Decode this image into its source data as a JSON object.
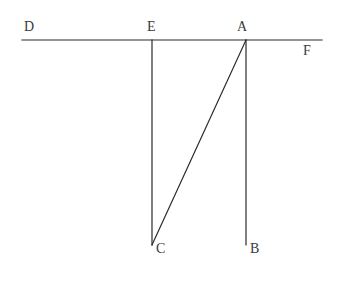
{
  "figure": {
    "background_color": "#ffffff",
    "stroke_color": "#2b2b2b",
    "label_color": "#3a3a3a",
    "stroke_width": 1.2,
    "width": 346,
    "height": 287
  },
  "labels": {
    "d": "D",
    "e": "E",
    "a": "A",
    "f": "F",
    "c": "C",
    "b": "B"
  },
  "geometry": {
    "points": [
      {
        "name": "D",
        "x": 22,
        "y": 40,
        "label_x": 24,
        "label_y": 20,
        "label_position": "above-right"
      },
      {
        "name": "E",
        "x": 152,
        "y": 40,
        "label_x": 147,
        "label_y": 20,
        "label_position": "above"
      },
      {
        "name": "A",
        "x": 246,
        "y": 40,
        "label_x": 237,
        "label_y": 20,
        "label_position": "above"
      },
      {
        "name": "F",
        "x": 322,
        "y": 40,
        "label_x": 303,
        "label_y": 44,
        "label_position": "below-left"
      },
      {
        "name": "C",
        "x": 152,
        "y": 245,
        "label_x": 156,
        "label_y": 242,
        "label_position": "below-right"
      },
      {
        "name": "B",
        "x": 246,
        "y": 245,
        "label_x": 250,
        "label_y": 242,
        "label_position": "below-right"
      }
    ],
    "segments": [
      {
        "name": "line-DF",
        "from": "D",
        "to": "F",
        "x1": 22,
        "y1": 40,
        "x2": 322,
        "y2": 40,
        "kind": "horizontal"
      },
      {
        "name": "segment-EC",
        "from": "E",
        "to": "C",
        "x1": 152,
        "y1": 40,
        "x2": 152,
        "y2": 245,
        "kind": "vertical"
      },
      {
        "name": "segment-AB",
        "from": "A",
        "to": "B",
        "x1": 246,
        "y1": 40,
        "x2": 246,
        "y2": 245,
        "kind": "vertical"
      },
      {
        "name": "segment-AC",
        "from": "A",
        "to": "C",
        "x1": 246,
        "y1": 40,
        "x2": 152,
        "y2": 245,
        "kind": "diagonal"
      }
    ]
  }
}
